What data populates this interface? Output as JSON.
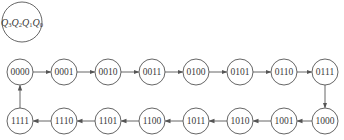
{
  "diagram": {
    "type": "state-transition",
    "header": {
      "label_parts": [
        {
          "q": "Q",
          "sub": "3"
        },
        {
          "q": "Q",
          "sub": "2"
        },
        {
          "q": "Q",
          "sub": "1"
        },
        {
          "q": "Q",
          "sub": "0"
        }
      ],
      "cx": 22,
      "cy": 22,
      "r": 20
    },
    "style": {
      "stroke_color": "#555555",
      "text_color": "#3a3a3a",
      "background": "#ffffff"
    },
    "states": [
      {
        "label": "0000",
        "cx": 20,
        "cy": 72
      },
      {
        "label": "0001",
        "cx": 64,
        "cy": 72
      },
      {
        "label": "0010",
        "cx": 108,
        "cy": 72
      },
      {
        "label": "0011",
        "cx": 152,
        "cy": 72
      },
      {
        "label": "0100",
        "cx": 196,
        "cy": 72
      },
      {
        "label": "0101",
        "cx": 240,
        "cy": 72
      },
      {
        "label": "0110",
        "cx": 284,
        "cy": 72
      },
      {
        "label": "0111",
        "cx": 325,
        "cy": 72
      },
      {
        "label": "1000",
        "cx": 325,
        "cy": 121
      },
      {
        "label": "1001",
        "cx": 284,
        "cy": 121
      },
      {
        "label": "1010",
        "cx": 240,
        "cy": 121
      },
      {
        "label": "1011",
        "cx": 196,
        "cy": 121
      },
      {
        "label": "1100",
        "cx": 152,
        "cy": 121
      },
      {
        "label": "1101",
        "cx": 108,
        "cy": 121
      },
      {
        "label": "1110",
        "cx": 64,
        "cy": 121
      },
      {
        "label": "1111",
        "cx": 20,
        "cy": 121
      }
    ],
    "node_radius": 13,
    "transitions": [
      [
        "0000",
        "0001"
      ],
      [
        "0001",
        "0010"
      ],
      [
        "0010",
        "0011"
      ],
      [
        "0011",
        "0100"
      ],
      [
        "0100",
        "0101"
      ],
      [
        "0101",
        "0110"
      ],
      [
        "0110",
        "0111"
      ],
      [
        "0111",
        "1000"
      ],
      [
        "1000",
        "1001"
      ],
      [
        "1001",
        "1010"
      ],
      [
        "1010",
        "1011"
      ],
      [
        "1011",
        "1100"
      ],
      [
        "1100",
        "1101"
      ],
      [
        "1101",
        "1110"
      ],
      [
        "1110",
        "1111"
      ],
      [
        "1111",
        "0000"
      ]
    ]
  }
}
